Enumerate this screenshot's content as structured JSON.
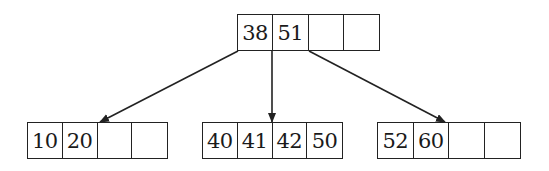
{
  "diagram": {
    "type": "b-tree",
    "colors": {
      "stroke": "#222222",
      "text": "#1a1a1a",
      "background": "#ffffff"
    },
    "root": {
      "keys": [
        "38",
        "51",
        "",
        ""
      ],
      "x": 237,
      "y": 14,
      "w": 143,
      "h": 37
    },
    "children": [
      {
        "keys": [
          "10",
          "20",
          "",
          ""
        ],
        "x": 27,
        "y": 122,
        "w": 141,
        "h": 37
      },
      {
        "keys": [
          "40",
          "41",
          "42",
          "50"
        ],
        "x": 202,
        "y": 122,
        "w": 141,
        "h": 37
      },
      {
        "keys": [
          "52",
          "60",
          "",
          ""
        ],
        "x": 377,
        "y": 122,
        "w": 144,
        "h": 37
      }
    ],
    "edges": [
      {
        "from": [
          238,
          51
        ],
        "to": [
          100,
          122
        ]
      },
      {
        "from": [
          272,
          51
        ],
        "to": [
          272,
          122
        ]
      },
      {
        "from": [
          309,
          51
        ],
        "to": [
          445,
          122
        ]
      }
    ]
  }
}
